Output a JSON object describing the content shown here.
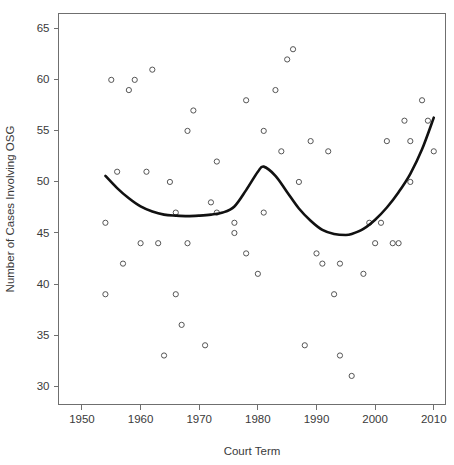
{
  "chart_data": {
    "type": "scatter",
    "title": "",
    "xlabel": "Court Term",
    "ylabel": "Number of Cases Involving OSG",
    "xlim": [
      1946,
      2012
    ],
    "ylim": [
      28.2,
      66.5
    ],
    "grid": false,
    "legend": "none",
    "xticks": [
      1950,
      1960,
      1970,
      1980,
      1990,
      2000,
      2010
    ],
    "xtick_labels": [
      "1950",
      "1960",
      "1970",
      "1980",
      "1990",
      "2000",
      "2010"
    ],
    "yticks": [
      30,
      35,
      40,
      45,
      50,
      55,
      60,
      65
    ],
    "ytick_labels": [
      "30",
      "35",
      "40",
      "45",
      "50",
      "55",
      "60",
      "65"
    ],
    "marker": "open-circle",
    "marker_radius": 2.6,
    "point_color": "#555555",
    "line_color": "#111111",
    "x": [
      1954,
      1954,
      1955,
      1956,
      1957,
      1958,
      1958,
      1959,
      1959,
      1960,
      1961,
      1961,
      1962,
      1963,
      1964,
      1964,
      1965,
      1966,
      1966,
      1967,
      1968,
      1968,
      1969,
      1970,
      1971,
      1972,
      1973,
      1973,
      1974,
      1975,
      1976,
      1976,
      1977,
      1978,
      1979,
      1980,
      1981,
      1981,
      1982,
      1983,
      1984,
      1984,
      1985,
      1985,
      1986,
      1987,
      1988,
      1989,
      1990,
      1991,
      1992,
      1993,
      1993,
      1994,
      1995,
      1996,
      1998,
      1998,
      1999,
      2000,
      2001,
      2002,
      2003,
      2004,
      2005,
      2006,
      2006,
      2008,
      2009,
      2010
    ],
    "y": [
      46,
      39,
      60,
      51,
      42,
      59,
      60,
      44,
      51,
      44,
      61,
      42,
      51,
      44,
      33,
      50,
      47,
      39,
      44,
      36,
      55,
      44,
      57,
      34,
      52,
      48,
      47,
      46,
      45,
      43,
      58,
      47,
      41,
      55,
      53,
      59,
      62,
      63,
      50,
      34,
      54,
      43,
      42,
      53,
      42,
      39,
      33,
      31,
      41,
      44,
      46,
      46,
      54,
      44,
      44,
      56,
      54,
      50,
      58,
      56,
      53,
      53,
      47,
      47,
      46,
      46,
      45,
      47,
      46,
      47
    ],
    "points": [
      {
        "x": 1954,
        "y": 46
      },
      {
        "x": 1954,
        "y": 39
      },
      {
        "x": 1955,
        "y": 60
      },
      {
        "x": 1956,
        "y": 51
      },
      {
        "x": 1957,
        "y": 42
      },
      {
        "x": 1958,
        "y": 59
      },
      {
        "x": 1959,
        "y": 60
      },
      {
        "x": 1960,
        "y": 44
      },
      {
        "x": 1961,
        "y": 51
      },
      {
        "x": 1962,
        "y": 61
      },
      {
        "x": 1963,
        "y": 44
      },
      {
        "x": 1964,
        "y": 33
      },
      {
        "x": 1965,
        "y": 50
      },
      {
        "x": 1966,
        "y": 47
      },
      {
        "x": 1966,
        "y": 39
      },
      {
        "x": 1967,
        "y": 36
      },
      {
        "x": 1968,
        "y": 55
      },
      {
        "x": 1968,
        "y": 44
      },
      {
        "x": 1969,
        "y": 57
      },
      {
        "x": 1971,
        "y": 34
      },
      {
        "x": 1973,
        "y": 52
      },
      {
        "x": 1972,
        "y": 48
      },
      {
        "x": 1973,
        "y": 47
      },
      {
        "x": 1976,
        "y": 46
      },
      {
        "x": 1976,
        "y": 45
      },
      {
        "x": 1978,
        "y": 43
      },
      {
        "x": 1978,
        "y": 58
      },
      {
        "x": 1981,
        "y": 47
      },
      {
        "x": 1980,
        "y": 41
      },
      {
        "x": 1981,
        "y": 55
      },
      {
        "x": 1983,
        "y": 59
      },
      {
        "x": 1984,
        "y": 53
      },
      {
        "x": 1985,
        "y": 62
      },
      {
        "x": 1986,
        "y": 63
      },
      {
        "x": 1987,
        "y": 50
      },
      {
        "x": 1988,
        "y": 34
      },
      {
        "x": 1989,
        "y": 54
      },
      {
        "x": 1990,
        "y": 43
      },
      {
        "x": 1991,
        "y": 42
      },
      {
        "x": 1992,
        "y": 53
      },
      {
        "x": 1993,
        "y": 39
      },
      {
        "x": 1994,
        "y": 42
      },
      {
        "x": 1994,
        "y": 33
      },
      {
        "x": 1996,
        "y": 31
      },
      {
        "x": 1998,
        "y": 41
      },
      {
        "x": 2000,
        "y": 44
      },
      {
        "x": 2001,
        "y": 46
      },
      {
        "x": 1999,
        "y": 46
      },
      {
        "x": 2002,
        "y": 54
      },
      {
        "x": 2003,
        "y": 44
      },
      {
        "x": 2004,
        "y": 44
      },
      {
        "x": 2005,
        "y": 56
      },
      {
        "x": 2006,
        "y": 50
      },
      {
        "x": 2006,
        "y": 54
      },
      {
        "x": 2008,
        "y": 58
      },
      {
        "x": 2009,
        "y": 56
      },
      {
        "x": 2010,
        "y": 53
      }
    ],
    "trend_line": {
      "label": "lowess smoother",
      "x": [
        1954,
        1956,
        1958,
        1960,
        1962,
        1964,
        1966,
        1968,
        1970,
        1972,
        1974,
        1976,
        1978,
        1980,
        1981,
        1983,
        1985,
        1987,
        1989,
        1991,
        1993,
        1995,
        1996,
        1998,
        2000,
        2002,
        2004,
        2006,
        2008,
        2010
      ],
      "y": [
        50.6,
        49.4,
        48.4,
        47.6,
        47.1,
        46.8,
        46.7,
        46.65,
        46.7,
        46.8,
        47.0,
        47.6,
        49.2,
        51.0,
        51.5,
        50.6,
        49.0,
        47.4,
        46.2,
        45.3,
        44.9,
        44.8,
        44.9,
        45.4,
        46.3,
        47.5,
        49.0,
        50.8,
        53.2,
        56.3
      ]
    }
  }
}
